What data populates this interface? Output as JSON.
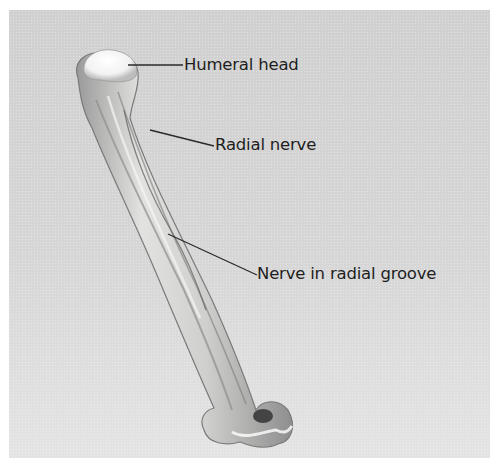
{
  "figure": {
    "labels": [
      {
        "id": "humeral-head",
        "text": "Humeral head"
      },
      {
        "id": "radial-nerve",
        "text": "Radial nerve"
      },
      {
        "id": "nerve-in-radial-groove",
        "text": "Nerve in radial groove"
      }
    ]
  },
  "colors": {
    "background": "#d3d3d3",
    "bone": "#e8e8e6",
    "bone_shadow": "#8c8c8c",
    "leader_line": "#2a2a2a",
    "text": "#1e1e1e"
  }
}
